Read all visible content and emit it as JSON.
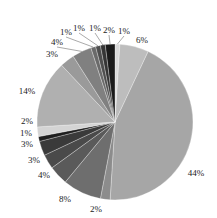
{
  "chart_data": {
    "type": "pie",
    "title": "",
    "start_angle_deg": 0,
    "direction": "clockwise",
    "center": [
      115,
      122
    ],
    "radius": 78,
    "slices": [
      {
        "label": "1%",
        "value": 1,
        "color": "#d9d9d9",
        "label_pos": [
          124,
          34
        ]
      },
      {
        "label": "6%",
        "value": 6,
        "color": "#bdbdbd",
        "label_pos": [
          142,
          43
        ]
      },
      {
        "label": "44%",
        "value": 44,
        "color": "#a6a6a6",
        "label_pos": [
          196,
          176
        ]
      },
      {
        "label": "2%",
        "value": 2,
        "color": "#8c8c8c",
        "label_pos": [
          96,
          212
        ]
      },
      {
        "label": "8%",
        "value": 8,
        "color": "#6e6e6e",
        "label_pos": [
          65,
          202
        ]
      },
      {
        "label": "4%",
        "value": 4,
        "color": "#5a5a5a",
        "label_pos": [
          44,
          178
        ]
      },
      {
        "label": "3%",
        "value": 3,
        "color": "#4a4a4a",
        "label_pos": [
          34,
          163
        ]
      },
      {
        "label": "3%",
        "value": 3,
        "color": "#3a3a3a",
        "label_pos": [
          27,
          147
        ]
      },
      {
        "label": "1%",
        "value": 1,
        "color": "#1e1e1e",
        "label_pos": [
          26,
          136
        ]
      },
      {
        "label": "2%",
        "value": 2,
        "color": "#d4d4d4",
        "label_pos": [
          27,
          124
        ]
      },
      {
        "label": "14%",
        "value": 14,
        "color": "#b0b0b0",
        "label_pos": [
          27,
          94
        ]
      },
      {
        "label": "3%",
        "value": 3,
        "color": "#9a9a9a",
        "label_pos": [
          52,
          57
        ]
      },
      {
        "label": "4%",
        "value": 4,
        "color": "#808080",
        "label_pos": [
          57,
          45
        ]
      },
      {
        "label": "1%",
        "value": 1,
        "color": "#6a6a6a",
        "label_pos": [
          66,
          35
        ]
      },
      {
        "label": "1%",
        "value": 1,
        "color": "#4e4e4e",
        "label_pos": [
          79,
          31
        ]
      },
      {
        "label": "1%",
        "value": 1,
        "color": "#353535",
        "label_pos": [
          95,
          31
        ]
      },
      {
        "label": "2%",
        "value": 2,
        "color": "#1a1a1a",
        "label_pos": [
          109,
          33
        ]
      }
    ],
    "legend": null,
    "grid": false
  }
}
